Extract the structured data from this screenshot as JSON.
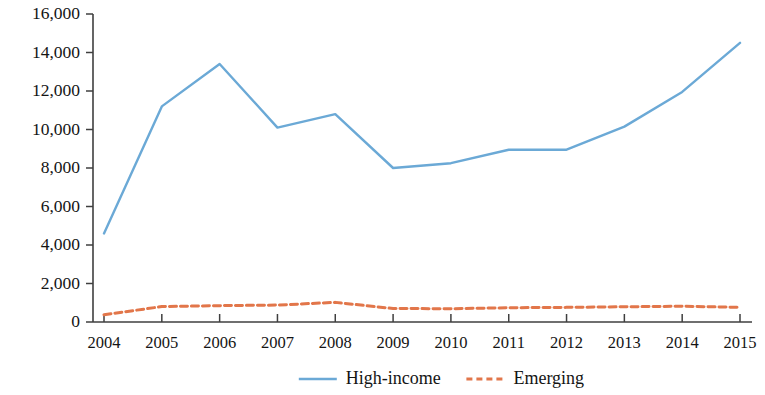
{
  "chart_data": {
    "type": "line",
    "title": "",
    "subtitle": "",
    "xlabel": "",
    "ylabel": "",
    "x": [
      "2004",
      "2005",
      "2006",
      "2007",
      "2008",
      "2009",
      "2010",
      "2011",
      "2012",
      "2013",
      "2014",
      "2015"
    ],
    "categories": [
      "2004",
      "2005",
      "2006",
      "2007",
      "2008",
      "2009",
      "2010",
      "2011",
      "2012",
      "2013",
      "2014",
      "2015"
    ],
    "series": [
      {
        "name": "High-income",
        "color": "#6BA9D6",
        "style": "solid",
        "values": [
          4600,
          11200,
          13400,
          10100,
          10800,
          8000,
          8250,
          8950,
          8950,
          10150,
          11950,
          14500
        ]
      },
      {
        "name": "Emerging",
        "color": "#E2764A",
        "style": "dashed",
        "values": [
          380,
          800,
          850,
          880,
          1020,
          700,
          690,
          740,
          760,
          790,
          820,
          760
        ]
      }
    ],
    "ylim": [
      0,
      16000
    ],
    "ytick_values": [
      0,
      2000,
      4000,
      6000,
      8000,
      10000,
      12000,
      14000,
      16000
    ],
    "ytick_labels": [
      "0",
      "2,000",
      "4,000",
      "6,000",
      "8,000",
      "10,000",
      "12,000",
      "14,000",
      "16,000"
    ],
    "xtick_labels": [
      "2004",
      "2005",
      "2006",
      "2007",
      "2008",
      "2009",
      "2010",
      "2011",
      "2012",
      "2013",
      "2014",
      "2015"
    ],
    "grid": false,
    "legend_position": "bottom",
    "legend": [
      {
        "label": "High-income",
        "color": "#6BA9D6",
        "style": "solid"
      },
      {
        "label": "Emerging",
        "color": "#E2764A",
        "style": "dashed"
      }
    ],
    "axis_color": "#3f3f3f",
    "background": "#ffffff"
  }
}
